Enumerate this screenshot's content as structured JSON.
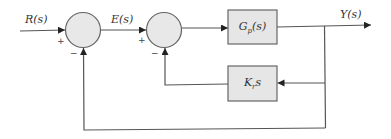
{
  "diagram": {
    "type": "control-system-block-diagram",
    "signals": {
      "input": "R(s)",
      "error": "E(s)",
      "output": "Y(s)"
    },
    "blocks": [
      {
        "id": "plant",
        "label_main": "G",
        "label_sub": "p",
        "label_tail": "(s)"
      },
      {
        "id": "rate-feedback",
        "label_main": "K",
        "label_sub": "r",
        "label_tail": "s"
      }
    ],
    "summing_junctions": [
      {
        "id": "sum1",
        "plus": "+",
        "minus": "−"
      },
      {
        "id": "sum2",
        "plus": "+",
        "minus": "−"
      }
    ],
    "colors": {
      "line": "#555555",
      "block_fill": "#e6e6e6",
      "junction_fill": "#e8e8e8",
      "stroke": "#666666"
    }
  }
}
